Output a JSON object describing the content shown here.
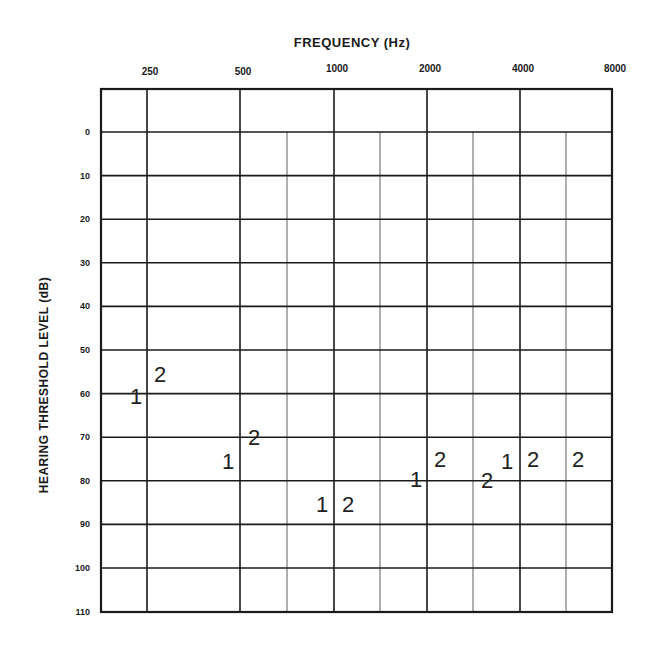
{
  "chart_data": {
    "type": "scatter",
    "title": "FREQUENCY (Hz)",
    "xlabel": "FREQUENCY (Hz)",
    "ylabel": "HEARING THRESHOLD LEVEL (dB)",
    "x_tick_labels": [
      "250",
      "500",
      "1000",
      "2000",
      "4000",
      "8000"
    ],
    "y_tick_labels": [
      "0",
      "10",
      "20",
      "30",
      "40",
      "50",
      "60",
      "70",
      "80",
      "90",
      "100",
      "110"
    ],
    "x_scale": "log2",
    "y_inverted": true,
    "ylim": [
      -10,
      110
    ],
    "grid": true,
    "minor_x_gridlines_hz": [
      750,
      1500,
      3000,
      6000
    ],
    "series": [
      {
        "name": "1",
        "marker": "1",
        "points": [
          {
            "x": 250,
            "y": 60
          },
          {
            "x": 500,
            "y": 75
          },
          {
            "x": 1000,
            "y": 85
          },
          {
            "x": 2000,
            "y": 80
          },
          {
            "x": 3000,
            "y": 75
          }
        ]
      },
      {
        "name": "2",
        "marker": "2",
        "points": [
          {
            "x": 250,
            "y": 57
          },
          {
            "x": 500,
            "y": 70
          },
          {
            "x": 1000,
            "y": 85
          },
          {
            "x": 2000,
            "y": 75
          },
          {
            "x": 3000,
            "y": 80
          },
          {
            "x": 4000,
            "y": 75
          },
          {
            "x": 6000,
            "y": 75
          }
        ]
      }
    ]
  },
  "labels": {
    "title": "FREQUENCY (Hz)",
    "ylabel": "HEARING THRESHOLD LEVEL (dB)"
  },
  "markers": [
    {
      "text": "1",
      "x": 136,
      "y": 397
    },
    {
      "text": "2",
      "x": 160,
      "y": 375
    },
    {
      "text": "1",
      "x": 228,
      "y": 462
    },
    {
      "text": "2",
      "x": 254,
      "y": 438
    },
    {
      "text": "1",
      "x": 322,
      "y": 505
    },
    {
      "text": "2",
      "x": 348,
      "y": 505
    },
    {
      "text": "1",
      "x": 416,
      "y": 480
    },
    {
      "text": "2",
      "x": 440,
      "y": 460
    },
    {
      "text": "2",
      "x": 487,
      "y": 481
    },
    {
      "text": "1",
      "x": 507,
      "y": 462
    },
    {
      "text": "2",
      "x": 533,
      "y": 460
    },
    {
      "text": "2",
      "x": 578,
      "y": 460
    }
  ]
}
